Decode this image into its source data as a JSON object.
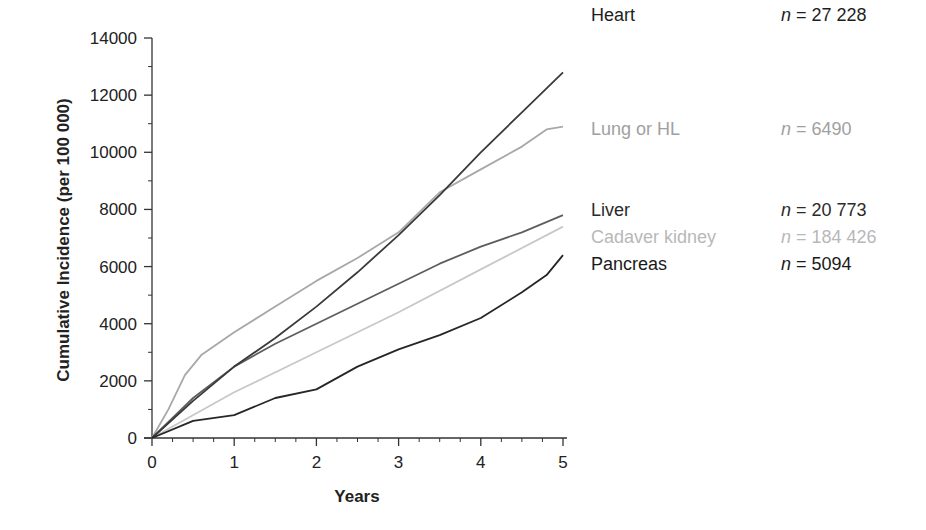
{
  "chart_data": {
    "type": "line",
    "title": "",
    "xlabel": "Years",
    "ylabel": "Cumulative Incidence (per 100 000)",
    "xlim": [
      0,
      5
    ],
    "ylim": [
      0,
      14000
    ],
    "x_ticks": [
      "0",
      "1",
      "2",
      "3",
      "4",
      "5"
    ],
    "y_ticks": [
      "0",
      "2000",
      "4000",
      "6000",
      "8000",
      "10000",
      "12000",
      "14000"
    ],
    "grid": false,
    "legend_position": "right",
    "series": [
      {
        "name": "Heart",
        "n_label": "n = 27 228",
        "n_value": "27 228",
        "color": "#3a3a3a",
        "x": [
          0,
          0.5,
          1,
          1.5,
          2,
          2.5,
          3,
          3.5,
          4,
          4.5,
          5
        ],
        "values": [
          0,
          1300,
          2500,
          3500,
          4600,
          5800,
          7100,
          8500,
          10000,
          11400,
          12800
        ]
      },
      {
        "name": "Lung or HL",
        "n_label": "n = 6490",
        "n_value": "6490",
        "color": "#a8a8a8",
        "x": [
          0,
          0.2,
          0.4,
          0.6,
          1,
          1.5,
          2,
          2.5,
          3,
          3.5,
          4,
          4.5,
          4.8,
          5
        ],
        "values": [
          0,
          1000,
          2200,
          2900,
          3700,
          4600,
          5500,
          6300,
          7200,
          8600,
          9400,
          10200,
          10800,
          10900
        ]
      },
      {
        "name": "Liver",
        "n_label": "n = 20 773",
        "n_value": "20 773",
        "color": "#5e5e5e",
        "x": [
          0,
          0.5,
          1,
          1.5,
          2,
          2.5,
          3,
          3.5,
          4,
          4.5,
          5
        ],
        "values": [
          0,
          1400,
          2500,
          3300,
          4000,
          4700,
          5400,
          6100,
          6700,
          7200,
          7800
        ]
      },
      {
        "name": "Cadaver kidney",
        "n_label": "n = 184 426",
        "n_value": "184 426",
        "color": "#c8c8c8",
        "x": [
          0,
          1,
          2,
          3,
          4,
          5
        ],
        "values": [
          0,
          1600,
          3000,
          4400,
          5900,
          7400
        ]
      },
      {
        "name": "Pancreas",
        "n_label": "n = 5094",
        "n_value": "5094",
        "color": "#262626",
        "x": [
          0,
          0.5,
          1,
          1.5,
          2,
          2.5,
          3,
          3.5,
          4,
          4.5,
          4.8,
          5
        ],
        "values": [
          0,
          600,
          800,
          1400,
          1700,
          2500,
          3100,
          3600,
          4200,
          5100,
          5700,
          6400
        ]
      }
    ]
  },
  "legend": {
    "items": [
      {
        "name": "Heart",
        "n_prefix": "n",
        "n_suffix": " = 27 228",
        "color": "#1e1e1e",
        "top": 4
      },
      {
        "name": "Lung or HL",
        "n_prefix": "n",
        "n_suffix": " = 6490",
        "color": "#a0a0a0",
        "top": 118
      },
      {
        "name": "Liver",
        "n_prefix": "n",
        "n_suffix": " = 20 773",
        "color": "#2a2a2a",
        "top": 199
      },
      {
        "name": "Cadaver kidney",
        "n_prefix": "n",
        "n_suffix": " = 184 426",
        "color": "#b8b8b8",
        "top": 226
      },
      {
        "name": "Pancreas",
        "n_prefix": "n",
        "n_suffix": " = 5094",
        "color": "#1a1a1a",
        "top": 253
      }
    ]
  }
}
